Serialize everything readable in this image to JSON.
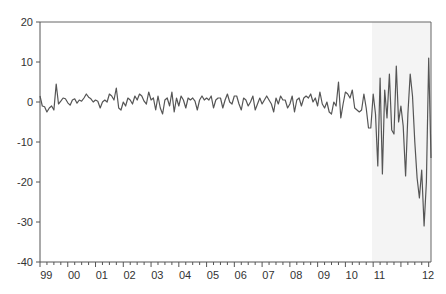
{
  "chart_data": {
    "type": "line",
    "title": "",
    "xlabel": "",
    "ylabel": "",
    "ylim": [
      -40,
      20
    ],
    "yticks": [
      20,
      10,
      0,
      -10,
      -20,
      -30,
      -40
    ],
    "xtick_labels": [
      "99",
      "00",
      "01",
      "02",
      "03",
      "04",
      "05",
      "06",
      "07",
      "08",
      "09",
      "10",
      "11",
      "12"
    ],
    "x_start": "1999M01",
    "frequency": "monthly",
    "grid": false,
    "legend": null,
    "shaded_region": {
      "from": "2009M11",
      "to": "2012M01",
      "color": "#f4f4f4"
    },
    "line_color": "#555555",
    "series": [
      {
        "name": "series",
        "values": [
          1.5,
          -1,
          -1.2,
          -2.5,
          -1.5,
          -1,
          -2,
          4.5,
          -0.5,
          0.2,
          1,
          0.8,
          -0.2,
          -0.8,
          0.5,
          0.8,
          -0.3,
          0.5,
          0.2,
          1,
          2,
          1.2,
          0.8,
          0,
          0.5,
          0.2,
          -1.5,
          0,
          0.5,
          0,
          2,
          1.5,
          0.5,
          3.5,
          -1.5,
          -2,
          0,
          -1,
          1,
          0.5,
          -0.5,
          1.5,
          0.5,
          2,
          1.5,
          0.2,
          -0.5,
          2.5,
          0.5,
          1,
          -2,
          1.5,
          -1.5,
          -3,
          0.5,
          1,
          -1,
          2.5,
          -2.5,
          1,
          -1,
          1.5,
          0.5,
          -1.5,
          1,
          0.5,
          1,
          0.2,
          -2,
          0.5,
          1.5,
          0.5,
          1,
          0.5,
          1.5,
          -1.5,
          0.5,
          1,
          1,
          -1.5,
          0.5,
          2,
          0,
          -0.5,
          1.5,
          1.5,
          -0.5,
          -2,
          1,
          0.5,
          -1,
          0,
          1.5,
          -2,
          -0.5,
          1,
          -0.5,
          0.5,
          1.5,
          0.5,
          -0.5,
          -2.5,
          1,
          -0.5,
          1.5,
          0.5,
          0.5,
          -1.5,
          -0.5,
          1.5,
          -2.5,
          0.5,
          1,
          -1,
          1,
          1.5,
          1,
          2,
          0,
          1,
          -1,
          2.5,
          -0.5,
          -1.5,
          0,
          -2.5,
          -3,
          0,
          -1,
          5,
          -4,
          -0.5,
          2.5,
          2,
          1,
          3,
          -1.5,
          -2,
          -2.5,
          -2,
          2,
          -1.5,
          -6.5,
          -6.5,
          2,
          -3,
          -16,
          6,
          -18,
          3,
          -4,
          7,
          -7,
          -8,
          9,
          -5,
          -1,
          -6,
          -18.5,
          -3,
          7,
          1.5,
          -10,
          -19,
          -24,
          -17,
          -31,
          -20,
          11,
          -14
        ]
      }
    ]
  }
}
